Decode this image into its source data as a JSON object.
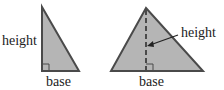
{
  "diagram": {
    "colors": {
      "fill": "#b5b5b5",
      "stroke": "#4a4a4a",
      "text": "#222222",
      "background": "#ffffff"
    },
    "left_triangle": {
      "type": "right-triangle",
      "height_label": "height",
      "base_label": "base"
    },
    "right_triangle": {
      "type": "acute-triangle",
      "height_label": "height",
      "base_label": "base"
    }
  }
}
